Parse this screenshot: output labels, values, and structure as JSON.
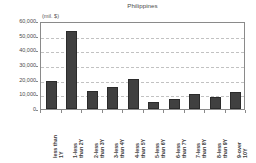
{
  "chart_data": {
    "type": "bar",
    "title": "Philippines",
    "units_label": "(mil. $)",
    "xlabel": "",
    "ylabel": "",
    "ylim": [
      0,
      60000
    ],
    "grid": true,
    "legend": "none",
    "y_ticks": [
      "0",
      "10,000",
      "20,000",
      "30,000",
      "40,000",
      "50,000",
      "60,000"
    ],
    "y_tick_values": [
      0,
      10000,
      20000,
      30000,
      40000,
      50000,
      60000
    ],
    "categories": [
      "less than\n1Y",
      "1-less\nthan 2Y",
      "2-less\nthan 3Y",
      "3-less\nthan 4Y",
      "4-less\nthan 5Y",
      "5-less\nthan 6Y",
      "6-less\nthan 7Y",
      "7-less\nthan 8Y",
      "8-less\nthan 9Y",
      "9-over\n10Y"
    ],
    "values": [
      19000,
      53000,
      12500,
      15000,
      20500,
      5000,
      7000,
      10500,
      8500,
      11500
    ],
    "series": [
      {
        "name": "Philippines",
        "values": [
          19000,
          53000,
          12500,
          15000,
          20500,
          5000,
          7000,
          10500,
          8500,
          11500
        ],
        "color": "#404040"
      }
    ]
  },
  "style": {
    "bar_color": "#404040",
    "grid_color": "#c2c2c2",
    "frame_color": "#8a8a8a",
    "text_color": "#3d3d3d",
    "background": "#ffffff"
  }
}
